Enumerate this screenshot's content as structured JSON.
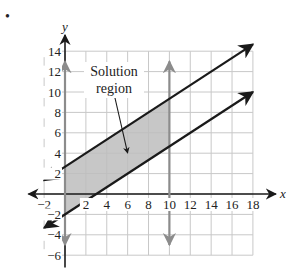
{
  "bullet": "•",
  "chart_data": {
    "type": "line",
    "title": "",
    "xlabel": "x",
    "ylabel": "y",
    "xlim": [
      -2,
      18
    ],
    "ylim": [
      -6,
      14
    ],
    "grid": true,
    "grid_step": 2,
    "x_ticks": [
      "−2",
      "2",
      "4",
      "6",
      "8",
      "10",
      "12",
      "14",
      "16",
      "18"
    ],
    "x_tick_values": [
      -2,
      2,
      4,
      6,
      8,
      10,
      12,
      14,
      16,
      18
    ],
    "y_ticks": [
      "14",
      "12",
      "10",
      "8",
      "6",
      "4",
      "2",
      "−2",
      "−4",
      "−6"
    ],
    "y_tick_values": [
      14,
      12,
      10,
      8,
      6,
      4,
      2,
      -2,
      -4,
      -6
    ],
    "series": [
      {
        "name": "upper boundary line",
        "x": [
          -2,
          18
        ],
        "y": [
          1.33,
          14.67
        ],
        "equation": "y = (2/3)x + 8/3",
        "style": "solid",
        "arrows": "both"
      },
      {
        "name": "lower boundary line",
        "x": [
          -2,
          18
        ],
        "y": [
          -3.33,
          10
        ],
        "equation": "y = (2/3)x - 2",
        "style": "solid",
        "arrows": "both"
      },
      {
        "name": "vertical line x=0",
        "x": [
          0,
          0
        ],
        "y": [
          -5,
          13
        ],
        "style": "gray",
        "arrows": "both"
      },
      {
        "name": "vertical line x=10",
        "x": [
          10,
          10
        ],
        "y": [
          -5,
          13
        ],
        "style": "gray",
        "arrows": "both"
      }
    ],
    "shaded_region": {
      "label": "Solution region",
      "vertices": [
        [
          0,
          2.67
        ],
        [
          10,
          9.33
        ],
        [
          10,
          4.67
        ],
        [
          0,
          -2
        ]
      ],
      "color": "#bdbdbd"
    },
    "annotations": [
      {
        "text_line1": "Solution",
        "text_line2": "region",
        "arrow_to": [
          6,
          4
        ]
      }
    ],
    "colors": {
      "lines": "#1a1a1a",
      "vertical_lines": "#8c8c8c",
      "grid": "#c8c8c8",
      "shade": "#bdbdbd"
    }
  }
}
